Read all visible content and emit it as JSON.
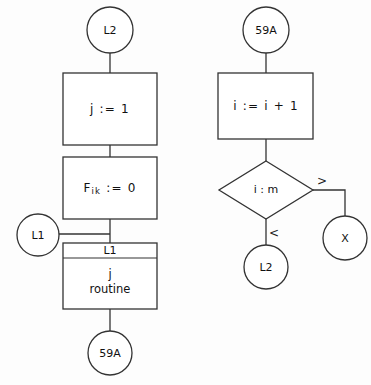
{
  "diagram": {
    "background_color": "#fdfdfd",
    "line_color": "#333333",
    "text_color": "#111111",
    "left_branch": {
      "entry_connector": "L2",
      "process_1": "j := 1",
      "process_2_base": "F",
      "process_2_subscript": "ik",
      "process_2_rest": ":= 0",
      "loop_back_connector": "L1",
      "subroutine_header": "L1",
      "subroutine_line_1": "j",
      "subroutine_line_2": "routine",
      "exit_connector": "59A"
    },
    "right_branch": {
      "entry_connector": "59A",
      "process_1": "i := i + 1",
      "decision": "i : m",
      "branch_greater_label": ">",
      "branch_less_label": "<",
      "exit_connector_greater": "X",
      "exit_connector_less": "L2"
    }
  }
}
